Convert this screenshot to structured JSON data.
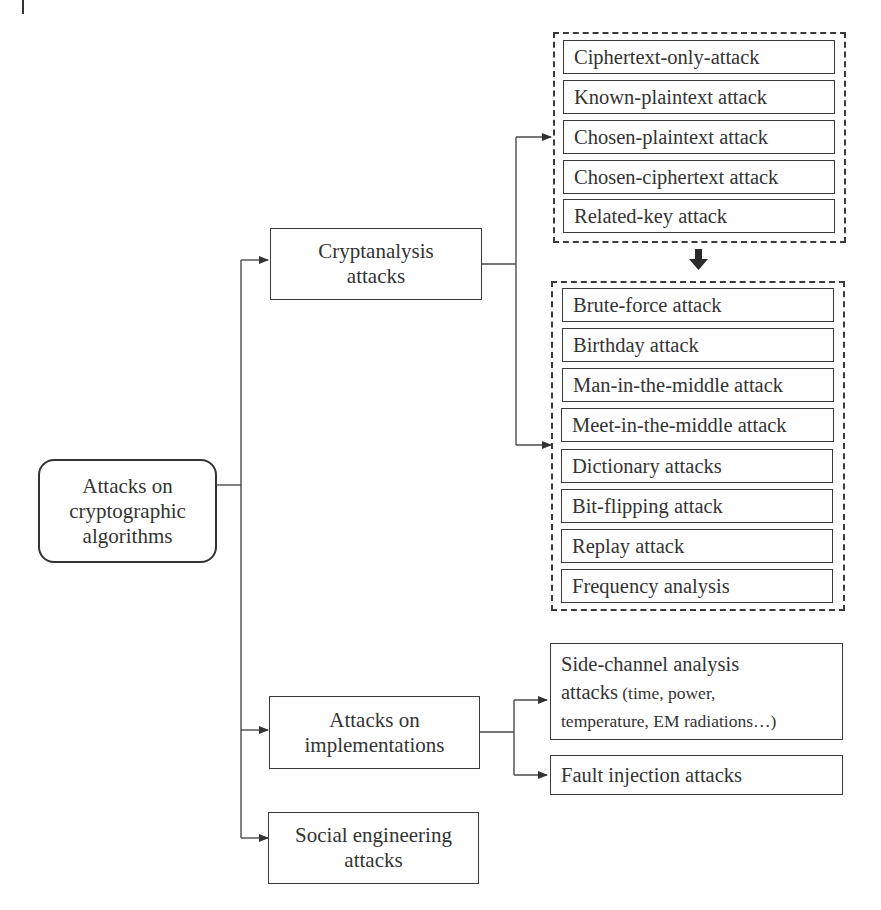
{
  "diagram": {
    "type": "hierarchy-tree",
    "root": {
      "label_lines": [
        "Attacks on",
        "cryptographic",
        "algorithms"
      ]
    },
    "branches": [
      {
        "id": "cryptanalysis",
        "label_lines": [
          "Cryptanalysis",
          "attacks"
        ],
        "groups": [
          {
            "id": "group-1",
            "items": [
              "Ciphertext-only-attack",
              "Known-plaintext attack",
              "Chosen-plaintext attack",
              "Chosen-ciphertext attack",
              "Related-key attack"
            ]
          },
          {
            "id": "group-2",
            "items": [
              "Brute-force attack",
              "Birthday attack",
              "Man-in-the-middle attack",
              "Meet-in-the-middle attack",
              "Dictionary attacks",
              "Bit-flipping attack",
              "Replay attack",
              "Frequency analysis"
            ]
          }
        ]
      },
      {
        "id": "implementations",
        "label_lines": [
          "Attacks on",
          "implementations"
        ],
        "children": [
          {
            "id": "side-channel",
            "line1": "Side-channel analysis",
            "line2_main": "attacks",
            "line2_detail": " (time, power,",
            "line3": "temperature, EM radiations…)"
          },
          {
            "id": "fault-injection",
            "label": "Fault injection attacks"
          }
        ]
      },
      {
        "id": "social",
        "label_lines": [
          "Social engineering",
          "attacks"
        ]
      }
    ],
    "group_link": "group-1 → group-2 (bold down arrow)",
    "colors": {
      "stroke": "#3a3a3a",
      "text": "#333333",
      "background": "#ffffff"
    }
  },
  "caption": {
    "visible": "clipped at bottom edge (text not legible)"
  }
}
